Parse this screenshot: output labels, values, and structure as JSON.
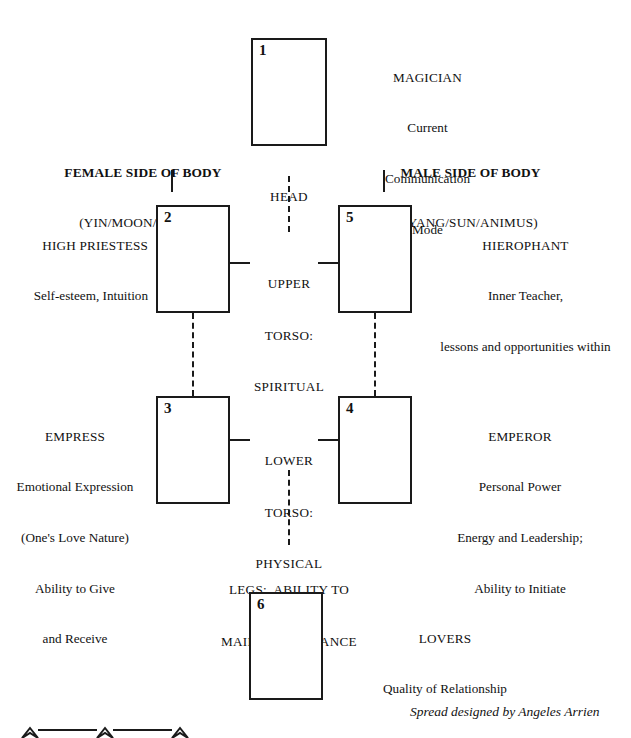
{
  "diagram": {
    "credit": "Spread designed by Angeles Arrien",
    "side_headers": {
      "female": {
        "title": "FEMALE SIDE OF BODY",
        "subtitle": "(YIN/MOON/ANIMA)"
      },
      "male": {
        "title": "MALE SIDE OF BODY",
        "subtitle": "(YANG/SUN/ANIMUS)"
      }
    },
    "body_zones": [
      {
        "id": "head",
        "lines": [
          "HEAD"
        ]
      },
      {
        "id": "upper-torso",
        "lines": [
          "UPPER",
          "TORSO:",
          "SPIRITUAL"
        ]
      },
      {
        "id": "lower-torso",
        "lines": [
          "LOWER",
          "TORSO:",
          "PHYSICAL"
        ]
      },
      {
        "id": "legs",
        "lines": [
          "LEGS:  ABILITY TO",
          "MAINTAIN BALANCE"
        ]
      }
    ],
    "cards": [
      {
        "number": "1",
        "name": "MAGICIAN",
        "meaning_lines": [
          "Current",
          "Communication",
          "Mode"
        ],
        "label_side": "right"
      },
      {
        "number": "2",
        "name": "HIGH PRIESTESS",
        "meaning_lines": [
          "Self-esteem, Intuition"
        ],
        "label_side": "left"
      },
      {
        "number": "3",
        "name": "EMPRESS",
        "meaning_lines": [
          "Emotional Expression",
          "(One's Love Nature)",
          "Ability to Give",
          "and Receive"
        ],
        "label_side": "left"
      },
      {
        "number": "4",
        "name": "EMPEROR",
        "meaning_lines": [
          "Personal Power",
          "Energy and Leadership;",
          "Ability to Initiate"
        ],
        "label_side": "right"
      },
      {
        "number": "5",
        "name": "HIEROPHANT",
        "meaning_lines": [
          "Inner Teacher,",
          "lessons and opportunities within"
        ],
        "label_side": "right"
      },
      {
        "number": "6",
        "name": "LOVERS",
        "meaning_lines": [
          "Quality of Relationship"
        ],
        "label_side": "right"
      }
    ]
  }
}
